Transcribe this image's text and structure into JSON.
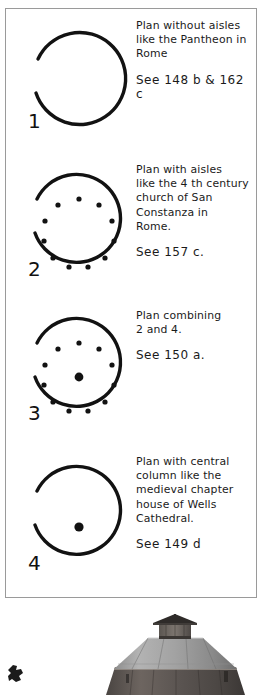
{
  "page": {
    "kind": "hand-drawn architectural plan sheet",
    "background_color": "#ffffff",
    "ink_color": "#111111",
    "frame_color": "#9a9a9a"
  },
  "plans": [
    {
      "numeral": "1",
      "description": "Plan without aisles\nlike the Pantheon in\nRome",
      "reference": "See 148 b & 162 c",
      "figure": {
        "name": "circle-plan-open",
        "column_ring_count": 0,
        "has_center_column": false,
        "gap_side": "left"
      }
    },
    {
      "numeral": "2",
      "description": "Plan with aisles\nlike the 4 th century\nchurch of San\nConstanza in\nRome.",
      "reference": "See   157 c.",
      "figure": {
        "name": "circle-plan-ring",
        "column_ring_count": 12,
        "has_center_column": false,
        "gap_side": "left"
      }
    },
    {
      "numeral": "3",
      "description": "Plan combining\n2 and 4.",
      "reference": "See   150 a.",
      "figure": {
        "name": "circle-plan-ring-and-center",
        "column_ring_count": 12,
        "has_center_column": true,
        "gap_side": "left"
      }
    },
    {
      "numeral": "4",
      "description": "Plan with central\ncolumn like the\nmedieval chapter\nhouse of Wells\nCathedral.",
      "reference": "See   149 d",
      "figure": {
        "name": "circle-plan-center-only",
        "column_ring_count": 0,
        "has_center_column": true,
        "gap_side": "left"
      }
    }
  ],
  "photo": {
    "name": "round-barn-photograph",
    "subject": "round barn with conical roof and cupola",
    "tone": "black and white"
  }
}
